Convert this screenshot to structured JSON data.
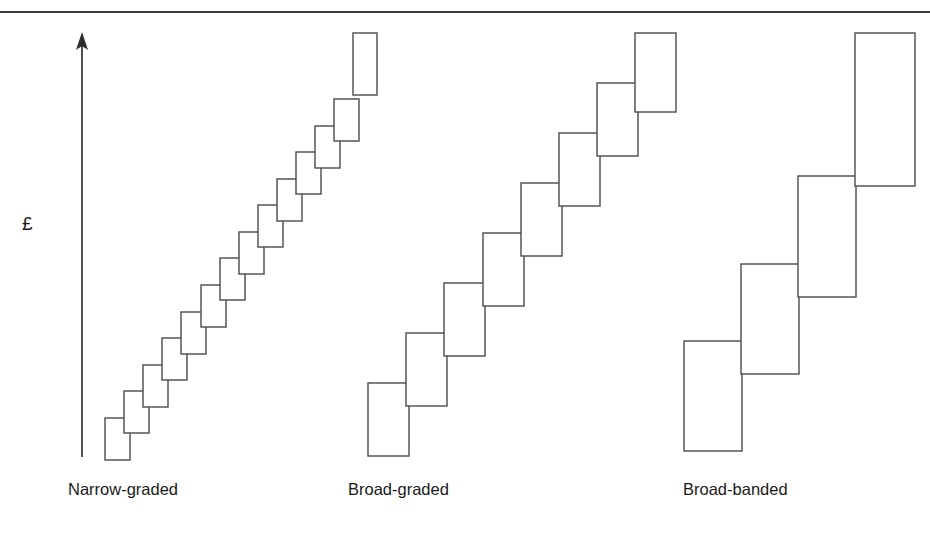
{
  "figure": {
    "axis": {
      "label": "£",
      "name": "y-axis",
      "orientation": "vertical",
      "arrow": "up",
      "x": 82,
      "y_top": 36,
      "y_bottom": 457
    },
    "top_rule": {
      "color": "#3d3d3d"
    },
    "colors": {
      "stroke": "#4a4a4a",
      "fill": "#ffffff",
      "text": "#1a1a1a",
      "rule": "#3d3d3d"
    },
    "labels": {
      "narrow": "Narrow-graded",
      "broad": "Broad-graded",
      "banded": "Broad-banded"
    }
  },
  "chart_data": {
    "type": "bar",
    "title": "",
    "subtitle": "",
    "xlabel": "",
    "ylabel": "£",
    "grid": false,
    "legend": "none",
    "categories": [
      "Narrow-graded",
      "Broad-graded",
      "Broad-banded"
    ],
    "values": [
      14,
      8,
      4
    ],
    "series": [
      {
        "name": "Narrow-graded",
        "label": "Narrow-graded",
        "grade_count": 14,
        "rect_width": 25,
        "rect_height": 42,
        "step_x": 19.1,
        "step_y": 26.6,
        "origin_x": 105,
        "origin_y_bottom": 460,
        "rects": [
          {
            "x": 105,
            "y": 418,
            "w": 25,
            "h": 42
          },
          {
            "x": 124,
            "y": 391,
            "w": 25,
            "h": 42
          },
          {
            "x": 143,
            "y": 365,
            "w": 25,
            "h": 42
          },
          {
            "x": 162,
            "y": 338,
            "w": 25,
            "h": 42
          },
          {
            "x": 181,
            "y": 312,
            "w": 25,
            "h": 42
          },
          {
            "x": 201,
            "y": 285,
            "w": 25,
            "h": 42
          },
          {
            "x": 220,
            "y": 258,
            "w": 25,
            "h": 42
          },
          {
            "x": 239,
            "y": 232,
            "w": 25,
            "h": 42
          },
          {
            "x": 258,
            "y": 205,
            "w": 25,
            "h": 42
          },
          {
            "x": 277,
            "y": 179,
            "w": 25,
            "h": 42
          },
          {
            "x": 296,
            "y": 152,
            "w": 25,
            "h": 42
          },
          {
            "x": 315,
            "y": 126,
            "w": 25,
            "h": 42
          },
          {
            "x": 334,
            "y": 99,
            "w": 25,
            "h": 42
          },
          {
            "x": 353,
            "y": 33,
            "w": 24,
            "h": 62
          }
        ]
      },
      {
        "name": "Broad-graded",
        "label": "Broad-graded",
        "grade_count": 8,
        "rect_width": 41,
        "rect_height": 73,
        "step_x": 38.2,
        "step_y": 50,
        "origin_x": 368,
        "origin_y_bottom": 456,
        "rects": [
          {
            "x": 368,
            "y": 383,
            "w": 41,
            "h": 73
          },
          {
            "x": 406,
            "y": 333,
            "w": 41,
            "h": 73
          },
          {
            "x": 444,
            "y": 283,
            "w": 41,
            "h": 73
          },
          {
            "x": 483,
            "y": 233,
            "w": 41,
            "h": 73
          },
          {
            "x": 521,
            "y": 183,
            "w": 41,
            "h": 73
          },
          {
            "x": 559,
            "y": 133,
            "w": 41,
            "h": 73
          },
          {
            "x": 597,
            "y": 83,
            "w": 41,
            "h": 73
          },
          {
            "x": 635,
            "y": 33,
            "w": 41,
            "h": 79
          }
        ]
      },
      {
        "name": "Broad-banded",
        "label": "Broad-banded",
        "grade_count": 4,
        "rect_width": 58,
        "rect_height": 110,
        "step_x": 57,
        "step_y": 77,
        "origin_x": 684,
        "origin_y_bottom": 451,
        "rects": [
          {
            "x": 684,
            "y": 341,
            "w": 58,
            "h": 110
          },
          {
            "x": 741,
            "y": 264,
            "w": 58,
            "h": 110
          },
          {
            "x": 798,
            "y": 176,
            "w": 58,
            "h": 121
          },
          {
            "x": 855,
            "y": 33,
            "w": 60,
            "h": 153
          }
        ]
      }
    ]
  }
}
